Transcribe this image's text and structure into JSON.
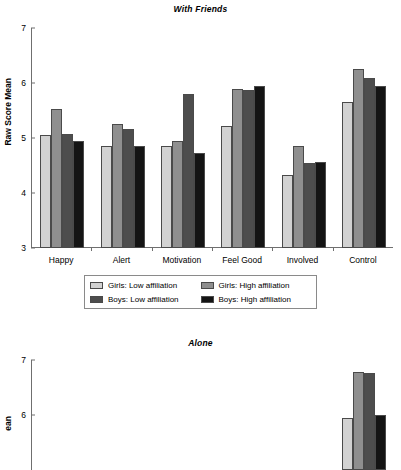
{
  "figure": {
    "ylabel": "Raw Score Mean",
    "ylabel_alone_visible": "ean",
    "yticks": [
      "7",
      "6",
      "5",
      "4",
      "3"
    ],
    "yticks_alone": [
      "7",
      "6"
    ],
    "colors": {
      "girls_low": "#d2d2d2",
      "girls_high": "#8f8f8f",
      "boys_low": "#4d4d4d",
      "boys_high": "#141414",
      "axis": "#6f6f6f"
    }
  },
  "legend": {
    "items": [
      {
        "label": "Girls: Low affiliation",
        "swatch": "#d2d2d2"
      },
      {
        "label": "Girls: High affiliation",
        "swatch": "#8f8f8f"
      },
      {
        "label": "Boys: Low affiliation",
        "swatch": "#4d4d4d"
      },
      {
        "label": "Boys: High affiliation",
        "swatch": "#141414"
      }
    ]
  },
  "chart_data": [
    {
      "type": "bar",
      "title": "With Friends",
      "xlabel": "",
      "ylabel": "Raw Score Mean",
      "ylim": [
        3,
        7
      ],
      "grid": false,
      "legend_position": "bottom",
      "categories": [
        "Happy",
        "Alert",
        "Motivation",
        "Feel Good",
        "Involved",
        "Control"
      ],
      "series": [
        {
          "name": "Girls: Low affiliation",
          "values": [
            5.05,
            4.85,
            4.86,
            5.21,
            4.33,
            5.66
          ]
        },
        {
          "name": "Girls: High affiliation",
          "values": [
            5.52,
            5.26,
            4.94,
            5.89,
            4.85,
            6.25
          ]
        },
        {
          "name": "Boys: Low affiliation",
          "values": [
            5.07,
            5.16,
            5.8,
            5.87,
            4.54,
            6.1
          ]
        },
        {
          "name": "Boys: High affiliation",
          "values": [
            4.95,
            4.86,
            4.73,
            5.94,
            4.56,
            5.94
          ]
        }
      ]
    },
    {
      "type": "bar",
      "title": "Alone",
      "xlabel": "",
      "ylabel": "Raw Score Mean",
      "ylim": [
        3,
        7
      ],
      "grid": false,
      "note": "panel cropped at image bottom edge",
      "categories": [
        "Happy",
        "Alert",
        "Motivation",
        "Feel Good",
        "Involved",
        "Control"
      ],
      "series": [
        {
          "name": "Girls: Low affiliation",
          "values": [
            null,
            null,
            null,
            null,
            null,
            5.95
          ]
        },
        {
          "name": "Girls: High affiliation",
          "values": [
            null,
            null,
            4.6,
            null,
            null,
            6.78
          ]
        },
        {
          "name": "Boys: Low affiliation",
          "values": [
            null,
            null,
            null,
            null,
            null,
            6.77
          ]
        },
        {
          "name": "Boys: High affiliation",
          "values": [
            null,
            null,
            null,
            null,
            null,
            6.0
          ]
        }
      ]
    }
  ]
}
